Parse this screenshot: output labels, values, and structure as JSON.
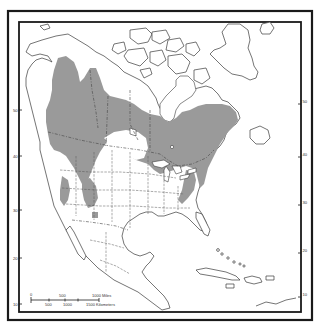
{
  "map": {
    "subject": "North America species range map",
    "range_fill_color": "#9a9a9a",
    "frame_color": "#1a1a1a",
    "latitude_labels_left": [
      {
        "value": "50",
        "y": 110
      },
      {
        "value": "40",
        "y": 156
      },
      {
        "value": "30",
        "y": 210
      },
      {
        "value": "20",
        "y": 258
      },
      {
        "value": "10",
        "y": 304
      }
    ],
    "latitude_labels_right": [
      {
        "value": "50",
        "y": 104
      },
      {
        "value": "40",
        "y": 157
      },
      {
        "value": "30",
        "y": 205
      },
      {
        "value": "20",
        "y": 253
      },
      {
        "value": "10",
        "y": 297
      }
    ],
    "scale_bar": {
      "miles_labels": [
        "0",
        "500",
        "1000 Miles"
      ],
      "km_labels": [
        "500",
        "1000",
        "1500 Kilometers"
      ]
    }
  }
}
